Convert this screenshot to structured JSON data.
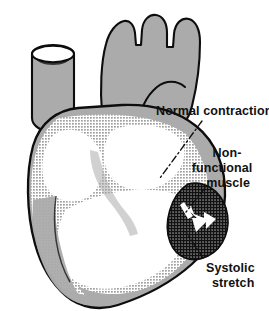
{
  "figure": {
    "width": 269,
    "height": 311,
    "background_color": "#ffffff"
  },
  "colors": {
    "muscle_gray": "#ababab",
    "outline_black": "#0d0d0d",
    "chamber_white": "#ffffff",
    "stipple_dot": "#3a3a3a",
    "infarct_black": "#111111",
    "label_text": "#111111",
    "leader_line": "#111111"
  },
  "labels": [
    {
      "id": "normal-contraction",
      "lines": [
        "Normal contraction"
      ],
      "x": 156,
      "y": 115
    },
    {
      "id": "non-functional-muscle",
      "lines": [
        "Non-",
        "functional",
        "muscle"
      ],
      "x": 208,
      "y": 157
    },
    {
      "id": "systolic-stretch",
      "lines": [
        "Systolic",
        "stretch"
      ],
      "x": 206,
      "y": 272
    }
  ],
  "anatomy": {
    "parts": [
      {
        "id": "aortic-arch",
        "name": "Aortic arch with brachiocephalic branches"
      },
      {
        "id": "cut-vessel",
        "name": "Transected great vessel (superior vena cava)"
      },
      {
        "id": "pulmonary-trunk",
        "name": "Pulmonary trunk"
      },
      {
        "id": "ventricular-wall",
        "name": "Stippled ventricular myocardium"
      },
      {
        "id": "chambers",
        "name": "Open ventricular chambers"
      },
      {
        "id": "infarct",
        "name": "Non-functional muscle (infarct) bulging outward"
      },
      {
        "id": "stretch-arrow",
        "name": "White arrow indicating systolic stretch"
      },
      {
        "id": "apex",
        "name": "Cardiac apex"
      }
    ]
  },
  "leaders": [
    {
      "id": "leader-normal-contraction",
      "style": "dash-dot",
      "from_label": "normal-contraction",
      "to_part": "ventricular-wall"
    },
    {
      "id": "leader-non-functional-muscle",
      "style": "dash-dot",
      "from_label": "non-functional-muscle",
      "to_part": "infarct"
    },
    {
      "id": "leader-systolic-stretch",
      "style": "dash-dot",
      "from_label": "systolic-stretch",
      "to_part": "infarct"
    }
  ]
}
